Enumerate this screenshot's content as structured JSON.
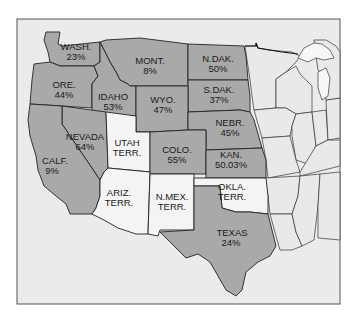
{
  "map": {
    "title": "Western States and Territories",
    "colors": {
      "shaded_state": "#a9a9a9",
      "territory": "#f4f4f4",
      "other_state": "#e9e9e9",
      "background": "#ebebeb"
    },
    "regions": {
      "wash": {
        "name": "WASH.",
        "value": "23%"
      },
      "mont": {
        "name": "MONT.",
        "value": "8%"
      },
      "ndak": {
        "name": "N.DAK.",
        "value": "50%"
      },
      "sdak": {
        "name": "S.DAK.",
        "value": "37%"
      },
      "ore": {
        "name": "ORE.",
        "value": "44%"
      },
      "idaho": {
        "name": "IDAHO",
        "value": "53%"
      },
      "wyo": {
        "name": "WYO.",
        "value": "47%"
      },
      "nebr": {
        "name": "NEBR.",
        "value": "45%"
      },
      "nevada": {
        "name": "NEVADA",
        "value": "64%"
      },
      "utah": {
        "name": "UTAH",
        "value": "TERR."
      },
      "colo": {
        "name": "COLO.",
        "value": "55%"
      },
      "kan": {
        "name": "KAN.",
        "value": "50.03%"
      },
      "calf": {
        "name": "CALF.",
        "value": "9%"
      },
      "ariz": {
        "name": "ARIZ.",
        "value": "TERR."
      },
      "nmex": {
        "name": "N.MEX.",
        "value": "TERR."
      },
      "okla": {
        "name": "OKLA.",
        "value": "TERR."
      },
      "texas": {
        "name": "TEXAS",
        "value": "24%"
      }
    }
  }
}
